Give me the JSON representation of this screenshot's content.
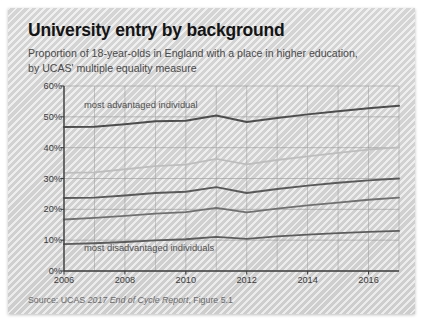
{
  "card": {
    "title": "University entry by background",
    "subtitle": "Proportion of 18-year-olds in England with a place in higher education, by UCAS' multiple equality measure",
    "source_prefix": "Source: UCAS ",
    "source_italic": "2017 End of Cycle Report",
    "source_suffix": ", Figure 5.1"
  },
  "chart_data": {
    "type": "line",
    "title": "University entry by background",
    "subtitle": "Proportion of 18-year-olds in England with a place in higher education, by UCAS' multiple equality measure",
    "xlabel": "",
    "ylabel": "",
    "x": [
      2006,
      2007,
      2008,
      2009,
      2010,
      2011,
      2012,
      2013,
      2014,
      2015,
      2016,
      2017
    ],
    "xlim": [
      2006,
      2017
    ],
    "xticks": [
      2006,
      2008,
      2010,
      2012,
      2014,
      2016
    ],
    "xticklabels": [
      "2006",
      "2008",
      "2010",
      "2012",
      "2014",
      "2016"
    ],
    "ylim": [
      0,
      60
    ],
    "yticks": [
      0,
      10,
      20,
      30,
      40,
      50,
      60
    ],
    "yticklabels": [
      "0%",
      "10%",
      "20%",
      "30%",
      "40%",
      "50%",
      "60%"
    ],
    "grid": true,
    "legend": "none",
    "annotations": [
      {
        "text": "most advantaged individual",
        "near_series": "Quintile 5 (most advantaged)"
      },
      {
        "text": "most disadvantaged individuals",
        "near_series": "Quintile 1 (most disadvantaged)"
      }
    ],
    "series": [
      {
        "name": "Quintile 5 (most advantaged)",
        "color": "#4d4d4d",
        "width": 2.0,
        "values": [
          46.7,
          46.8,
          47.6,
          48.6,
          48.7,
          50.4,
          48.3,
          49.6,
          50.8,
          51.8,
          52.8,
          53.6
        ]
      },
      {
        "name": "Quintile 4",
        "color": "#bdbdbd",
        "width": 1.8,
        "values": [
          31.8,
          32.0,
          33.0,
          34.0,
          34.5,
          36.4,
          34.6,
          36.0,
          37.2,
          38.3,
          39.4,
          40.1
        ]
      },
      {
        "name": "Quintile 3",
        "color": "#595959",
        "width": 1.9,
        "values": [
          23.7,
          23.8,
          24.5,
          25.3,
          25.7,
          27.2,
          25.3,
          26.6,
          27.7,
          28.6,
          29.4,
          30.0
        ]
      },
      {
        "name": "Quintile 2",
        "color": "#707070",
        "width": 1.8,
        "values": [
          16.7,
          17.2,
          17.9,
          18.6,
          19.1,
          20.5,
          19.0,
          20.2,
          21.3,
          22.2,
          23.1,
          23.8
        ]
      },
      {
        "name": "Quintile 1 (most disadvantaged)",
        "color": "#5c5c5c",
        "width": 1.8,
        "values": [
          8.7,
          9.0,
          9.4,
          9.9,
          10.3,
          11.1,
          10.4,
          11.2,
          11.8,
          12.3,
          12.7,
          13.0
        ]
      }
    ]
  }
}
